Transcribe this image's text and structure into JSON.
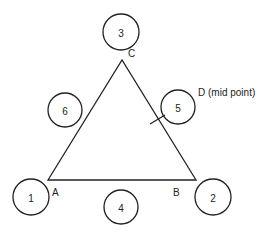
{
  "diagram": {
    "type": "triangle-with-numbered-positions",
    "vertices": [
      {
        "id": "A",
        "label": "A",
        "x": 48,
        "y": 180
      },
      {
        "id": "B",
        "label": "B",
        "x": 196,
        "y": 180
      },
      {
        "id": "C",
        "label": "C",
        "x": 122,
        "y": 60
      }
    ],
    "midpoint": {
      "id": "D",
      "label": "D (mid point)",
      "on_edge": "B-C"
    },
    "circles": [
      {
        "number": "1",
        "cx": 31,
        "cy": 197,
        "r": 18
      },
      {
        "number": "2",
        "cx": 213,
        "cy": 197,
        "r": 18
      },
      {
        "number": "3",
        "cx": 121,
        "cy": 32,
        "r": 18
      },
      {
        "number": "4",
        "cx": 121,
        "cy": 207,
        "r": 17
      },
      {
        "number": "5",
        "cx": 178,
        "cy": 107,
        "r": 17
      },
      {
        "number": "6",
        "cx": 65,
        "cy": 110,
        "r": 17
      }
    ]
  },
  "colors": {
    "stroke": "#222222",
    "background": "#ffffff"
  }
}
